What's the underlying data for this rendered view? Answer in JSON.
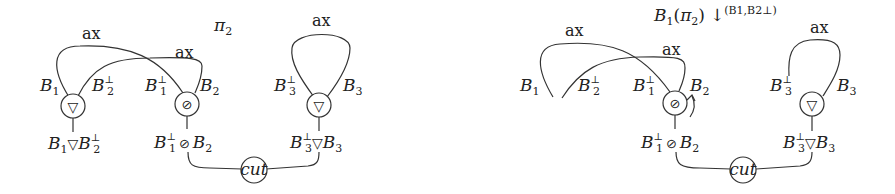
{
  "left_net": {
    "title": "π₂",
    "title_base": "π",
    "title_sub": "2",
    "axioms": [
      {
        "label": "ax",
        "ends": [
          "B1",
          "B1⊥"
        ]
      },
      {
        "label": "ax",
        "ends": [
          "B2⊥",
          "B2"
        ]
      },
      {
        "label": "ax",
        "ends": [
          "B3⊥",
          "B3"
        ]
      }
    ],
    "nodes": [
      {
        "type": "par",
        "symbol": "▽",
        "premises": [
          "B1",
          "B2⊥"
        ],
        "conclusion": "B1 ▽ B2⊥"
      },
      {
        "type": "tensor",
        "symbol": "⊘",
        "premises": [
          "B1⊥",
          "B2"
        ],
        "conclusion": "B1⊥ ⊘ B2"
      },
      {
        "type": "par",
        "symbol": "▽",
        "premises": [
          "B3⊥",
          "B3"
        ],
        "conclusion": "B3⊥ ▽ B3"
      },
      {
        "type": "cut",
        "label": "cut"
      }
    ]
  },
  "right_net": {
    "title": "S1(π2) ↓(B1,B2⊥)",
    "title_main": "S",
    "title_sub": "1",
    "title_arg": "(π",
    "title_arg_sub": "2",
    "title_close": ")",
    "arrow": "↓",
    "arrow_sup": "(B1,B2⊥)",
    "axioms": [
      {
        "label": "ax",
        "ends": [
          "B1",
          "B1⊥"
        ]
      },
      {
        "label": "ax",
        "ends": [
          "B2⊥",
          "B2"
        ]
      },
      {
        "label": "ax",
        "ends": [
          "B3⊥",
          "B3"
        ]
      }
    ],
    "nodes": [
      {
        "type": "tensor",
        "symbol": "⊘",
        "premises": [
          "B1⊥",
          "B2"
        ],
        "conclusion": "B1⊥ ⊘ B2"
      },
      {
        "type": "par",
        "symbol": "▽",
        "premises": [
          "B3⊥",
          "B3"
        ],
        "conclusion": "B3⊥ ▽ B3"
      },
      {
        "type": "cut",
        "label": "cut"
      }
    ],
    "annotation": "curved arrow next to tensor node"
  },
  "labels": {
    "ax": "ax",
    "B": "B",
    "one": "1",
    "two": "2",
    "three": "3",
    "perp": "⊥",
    "par": "▽",
    "tensor": "⊘",
    "cut": "cut",
    "pi": "π"
  }
}
